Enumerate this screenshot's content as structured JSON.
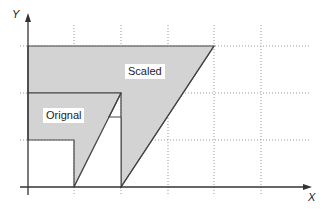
{
  "diagram": {
    "axes": {
      "x_label": "X",
      "y_label": "Y"
    },
    "shapes": [
      {
        "name": "Scaled",
        "label": "Scaled",
        "fill": "#d3d3d3"
      },
      {
        "name": "Original",
        "label": "Orignal",
        "fill": "#d3d3d3"
      }
    ],
    "grid": {
      "style": "dotted",
      "color": "#999999"
    }
  }
}
